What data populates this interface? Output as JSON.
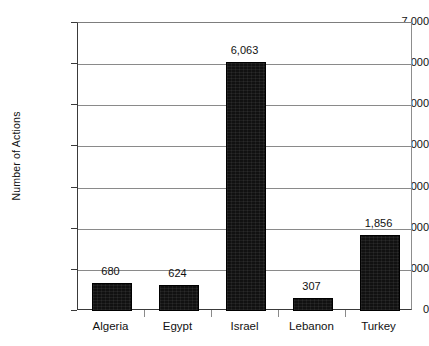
{
  "chart_data": {
    "type": "bar",
    "title": "",
    "xlabel": "",
    "ylabel": "Number of Actions",
    "categories": [
      "Algeria",
      "Egypt",
      "Israel",
      "Lebanon",
      "Turkey"
    ],
    "values": [
      680,
      624,
      6063,
      307,
      1856
    ],
    "value_labels": [
      "680",
      "624",
      "6,063",
      "307",
      "1,856"
    ],
    "ylim": [
      0,
      7000
    ],
    "ytick_values": [
      0,
      1000,
      2000,
      3000,
      4000,
      5000,
      6000,
      7000
    ],
    "ytick_labels": [
      "0",
      "1,000",
      "2,000",
      "3,000",
      "4,000",
      "5,000",
      "6,000",
      "7,000"
    ],
    "grid": "horizontal",
    "legend": "none",
    "bar_color": "#111111",
    "grid_color": "#8a8a8a",
    "axis_color": "#3a3a3a",
    "background": "#ffffff"
  }
}
